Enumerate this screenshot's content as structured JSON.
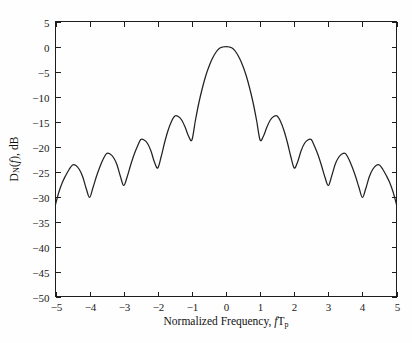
{
  "figure": {
    "background_color": "#fefefe",
    "axis_color": "#1d1d1d",
    "curve_color": "#222222"
  },
  "axis_titles": {
    "x_full": "Normalized Frequency, fTp",
    "x_prefix": "Normalized Frequency, ",
    "x_var": "f",
    "x_var2": "T",
    "x_sub": "p",
    "y_full": "DN(f), dB",
    "y_main": "D",
    "y_sub": "N",
    "y_paren_open": "(",
    "y_var": "f",
    "y_paren_close": ")",
    "y_unit": ", dB"
  },
  "chart_data": {
    "type": "line",
    "title": "",
    "subtitle": "",
    "xlabel": "Normalized Frequency, fTp",
    "ylabel": "DN(f), dB",
    "xlim": [
      -5,
      5
    ],
    "ylim": [
      -50,
      5
    ],
    "xticks": [
      -5,
      -4,
      -3,
      -2,
      -1,
      0,
      1,
      2,
      3,
      4,
      5
    ],
    "xtick_labels": [
      "−5",
      "−4",
      "−3",
      "−2",
      "−1",
      "0",
      "1",
      "2",
      "3",
      "4",
      "5"
    ],
    "yticks": [
      5,
      0,
      -5,
      -10,
      -15,
      -20,
      -25,
      -30,
      -35,
      -40,
      -45,
      -50
    ],
    "ytick_labels": [
      "5",
      "0",
      "−5",
      "−10",
      "−15",
      "−20",
      "−25",
      "−30",
      "−35",
      "−40",
      "−45",
      "−50"
    ],
    "grid": false,
    "legend": "none",
    "series": [
      {
        "name": "DN(f)",
        "color": "#222222",
        "peaks": [
          {
            "x": 0.0,
            "y": 0.0,
            "label": "main lobe peak"
          },
          {
            "x": 1.45,
            "y": -13.9,
            "label": "sidelobe 1"
          },
          {
            "x": 2.45,
            "y": -18.6,
            "label": "sidelobe 2"
          },
          {
            "x": 3.45,
            "y": -21.4,
            "label": "sidelobe 3"
          },
          {
            "x": 4.45,
            "y": -23.7,
            "label": "sidelobe 4"
          },
          {
            "x": -1.45,
            "y": -13.9,
            "label": "sidelobe -1"
          },
          {
            "x": -2.45,
            "y": -18.6,
            "label": "sidelobe -2"
          },
          {
            "x": -3.45,
            "y": -21.4,
            "label": "sidelobe -3"
          },
          {
            "x": -4.45,
            "y": -23.7,
            "label": "sidelobe -4"
          }
        ],
        "nulls": [
          {
            "x": -5.0,
            "y": -31.6
          },
          {
            "x": -4.05,
            "y": -30.2
          },
          {
            "x": -3.05,
            "y": -27.8
          },
          {
            "x": -2.05,
            "y": -24.3
          },
          {
            "x": -1.05,
            "y": -18.7
          },
          {
            "x": 1.05,
            "y": -18.7
          },
          {
            "x": 2.05,
            "y": -24.3
          },
          {
            "x": 3.05,
            "y": -27.8
          },
          {
            "x": 4.05,
            "y": -30.2
          },
          {
            "x": 5.0,
            "y": -31.6
          }
        ],
        "x": [
          -5.0,
          -4.9,
          -4.8,
          -4.7,
          -4.6,
          -4.5,
          -4.4,
          -4.3,
          -4.2,
          -4.1,
          -4.0,
          -3.9,
          -3.8,
          -3.7,
          -3.6,
          -3.5,
          -3.4,
          -3.3,
          -3.2,
          -3.1,
          -3.0,
          -2.9,
          -2.8,
          -2.7,
          -2.6,
          -2.5,
          -2.4,
          -2.3,
          -2.2,
          -2.1,
          -2.0,
          -1.9,
          -1.8,
          -1.7,
          -1.6,
          -1.5,
          -1.4,
          -1.3,
          -1.2,
          -1.1,
          -1.0,
          -0.9,
          -0.8,
          -0.7,
          -0.6,
          -0.5,
          -0.4,
          -0.3,
          -0.2,
          -0.1,
          0.0,
          0.1,
          0.2,
          0.3,
          0.4,
          0.5,
          0.6,
          0.7,
          0.8,
          0.9,
          1.0,
          1.1,
          1.2,
          1.3,
          1.4,
          1.5,
          1.6,
          1.7,
          1.8,
          1.9,
          2.0,
          2.1,
          2.2,
          2.3,
          2.4,
          2.5,
          2.6,
          2.7,
          2.8,
          2.9,
          3.0,
          3.1,
          3.2,
          3.3,
          3.4,
          3.5,
          3.6,
          3.7,
          3.8,
          3.9,
          4.0,
          4.1,
          4.2,
          4.3,
          4.4,
          4.5,
          4.6,
          4.7,
          4.8,
          4.9,
          5.0
        ],
        "y": [
          -31.6,
          -29.1,
          -27.2,
          -25.8,
          -24.6,
          -23.7,
          -23.8,
          -24.6,
          -26.1,
          -28.4,
          -30.2,
          -28.2,
          -26.0,
          -24.1,
          -22.5,
          -21.4,
          -21.5,
          -22.2,
          -23.6,
          -25.9,
          -27.8,
          -26.1,
          -23.8,
          -21.7,
          -20.0,
          -18.6,
          -18.7,
          -19.4,
          -20.9,
          -23.1,
          -24.3,
          -22.0,
          -19.2,
          -16.8,
          -15.0,
          -13.9,
          -14.0,
          -14.7,
          -16.1,
          -17.9,
          -18.7,
          -14.9,
          -11.4,
          -8.5,
          -6.0,
          -4.0,
          -2.4,
          -1.2,
          -0.4,
          -0.1,
          0.0,
          -0.1,
          -0.4,
          -1.2,
          -2.4,
          -4.0,
          -6.0,
          -8.5,
          -11.4,
          -14.9,
          -18.7,
          -17.9,
          -16.1,
          -14.7,
          -14.0,
          -13.9,
          -15.0,
          -16.8,
          -19.2,
          -22.0,
          -24.3,
          -23.1,
          -20.9,
          -19.4,
          -18.7,
          -18.6,
          -20.0,
          -21.7,
          -23.8,
          -26.1,
          -27.8,
          -25.9,
          -23.6,
          -22.2,
          -21.5,
          -21.4,
          -22.5,
          -24.1,
          -26.0,
          -28.2,
          -30.2,
          -28.4,
          -26.1,
          -24.6,
          -23.8,
          -23.7,
          -24.6,
          -25.8,
          -27.2,
          -29.1,
          -31.6
        ]
      }
    ]
  }
}
